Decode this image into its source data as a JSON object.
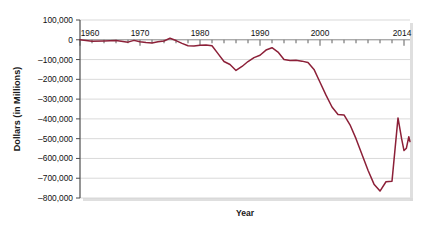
{
  "chart_data": {
    "type": "line",
    "title": "",
    "xlabel": "Year",
    "ylabel": "Dollars (in Millions)",
    "xlim": [
      1960,
      2014
    ],
    "ylim": [
      -800000,
      100000
    ],
    "grid": true,
    "legend": false,
    "line_color": "#8c2038",
    "y_ticks": [
      100000,
      0,
      -100000,
      -200000,
      -300000,
      -400000,
      -500000,
      -600000,
      -700000,
      -800000
    ],
    "y_tick_labels": [
      "100,000",
      "0",
      "–100,000",
      "–200,000",
      "–300,000",
      "–400,000",
      "–500,000",
      "–600,000",
      "–700,000",
      "–800,000"
    ],
    "x_ticks": [
      1960,
      1970,
      1980,
      1990,
      2000,
      2014
    ],
    "x_tick_labels": [
      "1960",
      "1970",
      "1980",
      "1990",
      "2000",
      "2014"
    ],
    "x_minor_tick_step": 2,
    "series": [
      {
        "name": "Federal Surplus or Deficit",
        "x": [
          1960,
          1961,
          1962,
          1963,
          1964,
          1965,
          1966,
          1967,
          1968,
          1969,
          1970,
          1971,
          1972,
          1973,
          1974,
          1975,
          1976,
          1977,
          1978,
          1979,
          1980,
          1981,
          1982,
          1983,
          1984,
          1985,
          1986,
          1987,
          1988,
          1989,
          1990,
          1991,
          1992,
          1993,
          1994,
          1995,
          1996,
          1997,
          1998,
          1999,
          2000,
          2001,
          2002,
          2003,
          2004,
          2005,
          2006,
          2007,
          2008,
          2009,
          2010,
          2011,
          2012,
          2013,
          2014
        ],
        "values": [
          300,
          -3300,
          -7100,
          -4800,
          -5900,
          -1400,
          -3700,
          -8600,
          -25200,
          3200,
          -2800,
          -23000,
          -23400,
          -14900,
          -6100,
          -53200,
          -73700,
          -53700,
          -59200,
          -40700,
          -73800,
          -79000,
          -128000,
          -207800,
          -185400,
          -212300,
          -221200,
          -149700,
          -155200,
          -152600,
          -221000,
          -269200,
          -290300,
          -255100,
          -203200,
          -164000,
          -107400,
          -21900,
          69300,
          125600,
          236200,
          128200,
          -157800,
          -377600,
          -412700,
          -318300,
          -248200,
          -160700,
          -458600,
          -1412700,
          -1294400,
          -1299600,
          -1087000,
          -679500,
          -484600
        ]
      }
    ],
    "rendered_points": [
      {
        "x": 1960,
        "y": 0
      },
      {
        "x": 1962,
        "y": -7000
      },
      {
        "x": 1964,
        "y": -6000
      },
      {
        "x": 1966,
        "y": -4000
      },
      {
        "x": 1968,
        "y": -12000
      },
      {
        "x": 1969,
        "y": -3000
      },
      {
        "x": 1970,
        "y": -10000
      },
      {
        "x": 1971,
        "y": -14000
      },
      {
        "x": 1972,
        "y": -16000
      },
      {
        "x": 1973,
        "y": -10000
      },
      {
        "x": 1974,
        "y": -6000
      },
      {
        "x": 1975,
        "y": 8000
      },
      {
        "x": 1976,
        "y": -4000
      },
      {
        "x": 1977,
        "y": -18000
      },
      {
        "x": 1978,
        "y": -30000
      },
      {
        "x": 1979,
        "y": -32000
      },
      {
        "x": 1980,
        "y": -28000
      },
      {
        "x": 1981,
        "y": -27000
      },
      {
        "x": 1982,
        "y": -30000
      },
      {
        "x": 1983,
        "y": -70000
      },
      {
        "x": 1984,
        "y": -110000
      },
      {
        "x": 1985,
        "y": -125000
      },
      {
        "x": 1986,
        "y": -155000
      },
      {
        "x": 1987,
        "y": -135000
      },
      {
        "x": 1988,
        "y": -110000
      },
      {
        "x": 1989,
        "y": -90000
      },
      {
        "x": 1990,
        "y": -78000
      },
      {
        "x": 1991,
        "y": -52000
      },
      {
        "x": 1992,
        "y": -40000
      },
      {
        "x": 1993,
        "y": -62000
      },
      {
        "x": 1994,
        "y": -100000
      },
      {
        "x": 1995,
        "y": -105000
      },
      {
        "x": 1996,
        "y": -103000
      },
      {
        "x": 1997,
        "y": -108000
      },
      {
        "x": 1998,
        "y": -115000
      },
      {
        "x": 1999,
        "y": -150000
      },
      {
        "x": 2000,
        "y": -215000
      },
      {
        "x": 2001,
        "y": -280000
      },
      {
        "x": 2002,
        "y": -340000
      },
      {
        "x": 2003,
        "y": -378000
      },
      {
        "x": 2004,
        "y": -380000
      },
      {
        "x": 2005,
        "y": -430000
      },
      {
        "x": 2006,
        "y": -500000
      },
      {
        "x": 2007,
        "y": -580000
      },
      {
        "x": 2008,
        "y": -660000
      },
      {
        "x": 2009,
        "y": -730000
      },
      {
        "x": 2010,
        "y": -765000
      },
      {
        "x": 2011,
        "y": -718000
      },
      {
        "x": 2012,
        "y": -715000
      },
      {
        "x": 2013,
        "y": -395000
      },
      {
        "x": 2013.6,
        "y": -500000
      },
      {
        "x": 2014,
        "y": -560000
      },
      {
        "x": 2014.4,
        "y": -548000
      },
      {
        "x": 2014.8,
        "y": -490000
      },
      {
        "x": 2015,
        "y": -515000
      }
    ]
  }
}
